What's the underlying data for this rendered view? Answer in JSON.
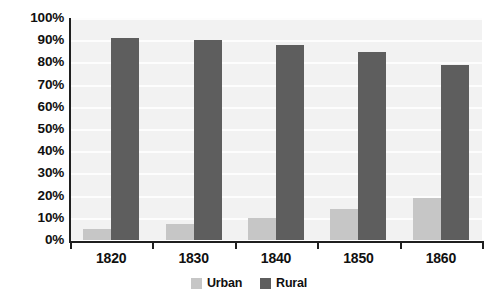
{
  "chart_data": {
    "type": "bar",
    "title": "",
    "subtitle": "",
    "xlabel": "",
    "ylabel": "",
    "categories": [
      "1820",
      "1830",
      "1840",
      "1850",
      "1860"
    ],
    "series": [
      {
        "name": "Urban",
        "color": "#c6c6c6",
        "values": [
          5,
          7,
          10,
          14,
          19
        ]
      },
      {
        "name": "Rural",
        "color": "#5e5e5e",
        "values": [
          91,
          90,
          88,
          84.5,
          79
        ]
      }
    ],
    "ylim": [
      0,
      100
    ],
    "ytick_labels": [
      "100%",
      "90%",
      "80%",
      "70%",
      "60%",
      "50%",
      "40%",
      "30%",
      "20%",
      "10%",
      "0%"
    ],
    "ytick_values": [
      100,
      90,
      80,
      70,
      60,
      50,
      40,
      30,
      20,
      10,
      0
    ],
    "grid": true,
    "grid_color": "#fdfdfd",
    "plot_background": "#f2f2f2",
    "axis_color": "#1f1f1f",
    "legend_position": "bottom-center",
    "legend": [
      {
        "label": "Urban",
        "color": "#c6c6c6"
      },
      {
        "label": "Rural",
        "color": "#5e5e5e"
      }
    ]
  }
}
